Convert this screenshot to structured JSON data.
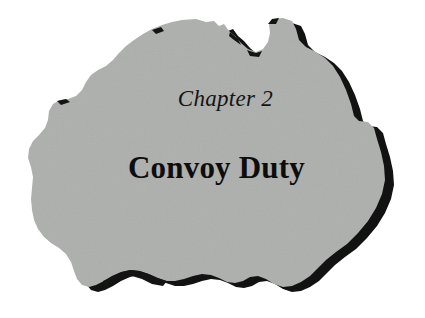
{
  "page": {
    "background_color": "#ffffff",
    "kind": "book-chapter-opening-page"
  },
  "chapter": {
    "number_label": "Chapter 2",
    "title": "Convoy Duty",
    "text_color": "#111111"
  },
  "figure": {
    "name": "australia-map-silhouette",
    "fill_color": "#adafad",
    "shadow_color": "#111111",
    "outline_style": "drop-shadow"
  }
}
